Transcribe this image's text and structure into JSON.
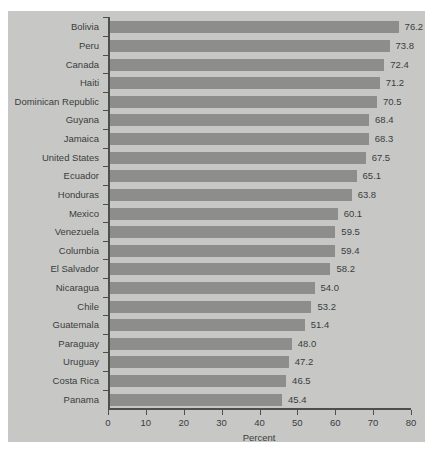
{
  "chart_data": {
    "type": "bar",
    "orientation": "horizontal",
    "title": "",
    "xlabel": "Percent",
    "ylabel": "",
    "xlim": [
      0,
      80
    ],
    "xticks": [
      0,
      10,
      20,
      30,
      40,
      50,
      60,
      70,
      80
    ],
    "grid": false,
    "legend": null,
    "categories": [
      "Bolivia",
      "Peru",
      "Canada",
      "Haiti",
      "Dominican Republic",
      "Guyana",
      "Jamaica",
      "United States",
      "Ecuador",
      "Honduras",
      "Mexico",
      "Venezuela",
      "Columbia",
      "El Salvador",
      "Nicaragua",
      "Chile",
      "Guatemala",
      "Paraguay",
      "Uruguay",
      "Costa Rica",
      "Panama"
    ],
    "values": [
      76.2,
      73.8,
      72.4,
      71.2,
      70.5,
      68.4,
      68.3,
      67.5,
      65.1,
      63.8,
      60.1,
      59.5,
      59.4,
      58.2,
      54.0,
      53.2,
      51.4,
      48.0,
      47.2,
      46.5,
      45.4
    ],
    "value_labels": [
      "76.2",
      "73.8",
      "72.4",
      "71.2",
      "70.5",
      "68.4",
      "68.3",
      "67.5",
      "65.1",
      "63.8",
      "60.1",
      "59.5",
      "59.4",
      "58.2",
      "54.0",
      "53.2",
      "51.4",
      "48.0",
      "47.2",
      "46.5",
      "45.4"
    ],
    "xtick_labels": [
      "0",
      "10",
      "20",
      "30",
      "40",
      "50",
      "60",
      "70",
      "80"
    ]
  },
  "colors": {
    "page_background": "#ffffff",
    "panel_background": "#c7c8c6",
    "bar_fill": "#8d8e8c",
    "axis": "#4d4f4e",
    "text": "#3a3c3b"
  }
}
